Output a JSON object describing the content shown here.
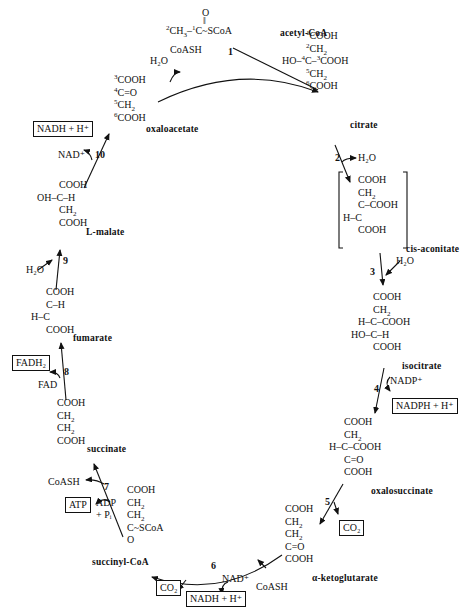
{
  "molecules": {
    "acetyl_coa": {
      "name": "acetyl-CoA",
      "formula": "²CH₃–¹C(=O)~SCoA"
    },
    "citrate": {
      "name": "citrate",
      "lines": [
        "¹COOH",
        "²CH₂",
        "HO–⁴C–³COOH",
        "⁵CH₂",
        "⁶COOH"
      ]
    },
    "cis_aconitate": {
      "name": "cis-aconitate",
      "lines": [
        "COOH",
        "CH₂",
        "C–COOH",
        "H–C",
        "COOH"
      ]
    },
    "isocitrate": {
      "name": "isocitrate",
      "lines": [
        "COOH",
        "CH₂",
        "H–C–COOH",
        "HO–C–H",
        "COOH"
      ]
    },
    "oxalosuccinate": {
      "name": "oxalosuccinate",
      "lines": [
        "COOH",
        "CH₂",
        "H–C–COOH",
        "C=O",
        "COOH"
      ]
    },
    "alpha_ketoglutarate": {
      "name": "α-ketoglutarate",
      "lines": [
        "COOH",
        "CH₂",
        "CH₂",
        "C=O",
        "COOH"
      ]
    },
    "succinyl_coa": {
      "name": "succinyl-CoA",
      "lines": [
        "COOH",
        "CH₂",
        "CH₂",
        "C~SCoA",
        "O"
      ]
    },
    "succinate": {
      "name": "succinate",
      "lines": [
        "COOH",
        "CH₂",
        "CH₂",
        "COOH"
      ]
    },
    "fumarate": {
      "name": "fumarate",
      "lines": [
        "COOH",
        "C–H",
        "H–C",
        "COOH"
      ]
    },
    "l_malate": {
      "name": "L-malate",
      "lines": [
        "COOH",
        "OH–C–H",
        "CH₂",
        "COOH"
      ]
    },
    "oxaloacetate": {
      "name": "oxaloacetate",
      "lines": [
        "³COOH",
        "⁴C=O",
        "⁵CH₂",
        "⁶COOH"
      ]
    }
  },
  "steps": [
    {
      "number": "1",
      "inputs": [
        "H₂O"
      ],
      "outputs": [
        "CoASH"
      ]
    },
    {
      "number": "2",
      "inputs": [],
      "outputs": [
        "H₂O"
      ]
    },
    {
      "number": "3",
      "inputs": [
        "H₂O"
      ],
      "outputs": []
    },
    {
      "number": "4",
      "inputs": [
        "NADP⁺"
      ],
      "outputs": [
        "NADPH + H⁺"
      ]
    },
    {
      "number": "5",
      "inputs": [],
      "outputs": [
        "CO₂"
      ]
    },
    {
      "number": "6",
      "inputs": [
        "NAD⁺",
        "CoASH"
      ],
      "outputs": [
        "CO₂",
        "NADH + H⁺"
      ]
    },
    {
      "number": "7",
      "inputs": [
        "ADP + Pᵢ"
      ],
      "outputs": [
        "CoASH",
        "ATP"
      ]
    },
    {
      "number": "8",
      "inputs": [
        "FAD"
      ],
      "outputs": [
        "FADH₂"
      ]
    },
    {
      "number": "9",
      "inputs": [
        "H₂O"
      ],
      "outputs": []
    },
    {
      "number": "10",
      "inputs": [
        "NAD⁺"
      ],
      "outputs": [
        "NADH + H⁺"
      ]
    }
  ],
  "labels": {
    "h2o": "H₂O",
    "coash": "CoASH",
    "nadp": "NADP⁺",
    "nad": "NAD⁺",
    "fad": "FAD",
    "adp": "ADP",
    "pi": "+ Pᵢ",
    "boxed": {
      "nadph": "NADPH + H⁺",
      "co2": "CO₂",
      "nadh": "NADH + H⁺",
      "atp": "ATP",
      "fadh2": "FADH₂"
    }
  }
}
